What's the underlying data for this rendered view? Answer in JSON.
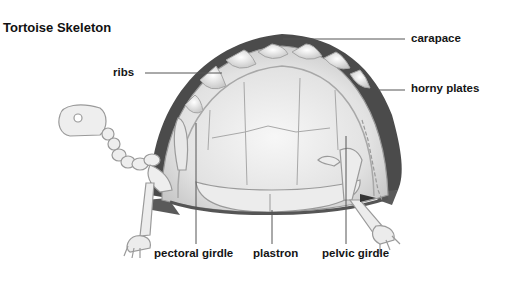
{
  "title": "Tortoise Skeleton",
  "labels": {
    "carapace": "carapace",
    "horny_plates": "horny plates",
    "ribs": "ribs",
    "pectoral_girdle": "pectoral girdle",
    "plastron": "plastron",
    "pelvic_girdle": "pelvic girdle"
  },
  "colors": {
    "shell_outer": "#4a4a4a",
    "bone": "#e6e6e6",
    "bone_outline": "#9a9a9a",
    "leader_line": "#555555",
    "text": "#151515"
  }
}
